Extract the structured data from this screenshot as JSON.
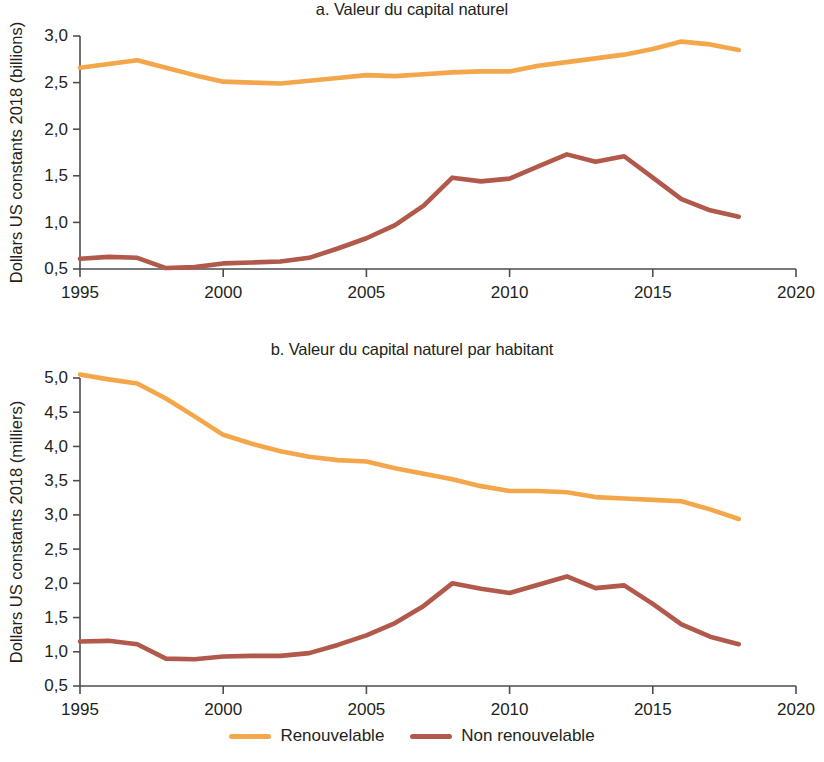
{
  "figure": {
    "background": "#ffffff",
    "width": 824,
    "height": 762
  },
  "colors": {
    "renewable": "#F4A64B",
    "nonrenewable": "#B15A4B",
    "axis": "#4d4d4d",
    "text": "#231f20"
  },
  "legend": {
    "position": "bottom-center",
    "entries": [
      {
        "label": "Renouvelable",
        "color": "#F4A64B"
      },
      {
        "label": "Non renouvelable",
        "color": "#B15A4B"
      }
    ]
  },
  "panel_a": {
    "title": "a. Valeur du capital naturel",
    "ylabel": "Dollars US constants 2018 (billions)",
    "yticks": [
      "0,5",
      "1,0",
      "1,5",
      "2,0",
      "2,5",
      "3,0"
    ],
    "xticks": [
      "1995",
      "2000",
      "2005",
      "2010",
      "2015",
      "2020"
    ]
  },
  "panel_b": {
    "title": "b. Valeur du capital naturel par habitant",
    "ylabel": "Dollars US constants 2018 (milliers)",
    "yticks": [
      "0,5",
      "1,0",
      "1,5",
      "2,0",
      "2,5",
      "3,0",
      "3,5",
      "4,0",
      "4,5",
      "5,0"
    ],
    "xticks": [
      "1995",
      "2000",
      "2005",
      "2010",
      "2015",
      "2020"
    ]
  },
  "chart_data": [
    {
      "type": "line",
      "panel": "a",
      "title": "a. Valeur du capital naturel",
      "xlabel": "",
      "ylabel": "Dollars US constants 2018 (billions)",
      "xlim": [
        1995,
        2020
      ],
      "ylim": [
        0.5,
        3.0
      ],
      "ytick_values": [
        0.5,
        1.0,
        1.5,
        2.0,
        2.5,
        3.0
      ],
      "xtick_values": [
        1995,
        2000,
        2005,
        2010,
        2015,
        2020
      ],
      "grid": false,
      "legend_position": "bottom-center",
      "x": [
        1995,
        1996,
        1997,
        1998,
        1999,
        2000,
        2001,
        2002,
        2003,
        2004,
        2005,
        2006,
        2007,
        2008,
        2009,
        2010,
        2011,
        2012,
        2013,
        2014,
        2015,
        2016,
        2017,
        2018
      ],
      "series": [
        {
          "name": "Renouvelable",
          "color": "#F4A64B",
          "values": [
            2.66,
            2.7,
            2.74,
            2.66,
            2.58,
            2.51,
            2.5,
            2.49,
            2.52,
            2.55,
            2.58,
            2.57,
            2.59,
            2.61,
            2.62,
            2.62,
            2.68,
            2.72,
            2.76,
            2.8,
            2.86,
            2.94,
            2.91,
            2.85
          ]
        },
        {
          "name": "Non renouvelable",
          "color": "#B15A4B",
          "values": [
            0.61,
            0.63,
            0.62,
            0.51,
            0.52,
            0.56,
            0.57,
            0.58,
            0.62,
            0.72,
            0.83,
            0.97,
            1.18,
            1.48,
            1.44,
            1.47,
            1.6,
            1.73,
            1.65,
            1.71,
            1.48,
            1.25,
            1.13,
            1.06
          ]
        }
      ]
    },
    {
      "type": "line",
      "panel": "b",
      "title": "b. Valeur du capital naturel par habitant",
      "xlabel": "",
      "ylabel": "Dollars US constants 2018 (milliers)",
      "xlim": [
        1995,
        2020
      ],
      "ylim": [
        0.5,
        5.0
      ],
      "ytick_values": [
        0.5,
        1.0,
        1.5,
        2.0,
        2.5,
        3.0,
        3.5,
        4.0,
        4.5,
        5.0
      ],
      "xtick_values": [
        1995,
        2000,
        2005,
        2010,
        2015,
        2020
      ],
      "grid": false,
      "legend_position": "bottom-center",
      "x": [
        1995,
        1996,
        1997,
        1998,
        1999,
        2000,
        2001,
        2002,
        2003,
        2004,
        2005,
        2006,
        2007,
        2008,
        2009,
        2010,
        2011,
        2012,
        2013,
        2014,
        2015,
        2016,
        2017,
        2018
      ],
      "series": [
        {
          "name": "Renouvelable",
          "color": "#F4A64B",
          "values": [
            5.05,
            4.98,
            4.92,
            4.7,
            4.44,
            4.17,
            4.04,
            3.93,
            3.85,
            3.8,
            3.78,
            3.68,
            3.6,
            3.52,
            3.42,
            3.35,
            3.35,
            3.33,
            3.26,
            3.24,
            3.22,
            3.2,
            3.08,
            2.94
          ]
        },
        {
          "name": "Non renouvelable",
          "color": "#B15A4B",
          "values": [
            1.15,
            1.16,
            1.11,
            0.9,
            0.89,
            0.93,
            0.94,
            0.94,
            0.98,
            1.1,
            1.24,
            1.42,
            1.67,
            2.0,
            1.92,
            1.86,
            1.98,
            2.1,
            1.93,
            1.97,
            1.7,
            1.4,
            1.22,
            1.11
          ]
        }
      ]
    }
  ]
}
